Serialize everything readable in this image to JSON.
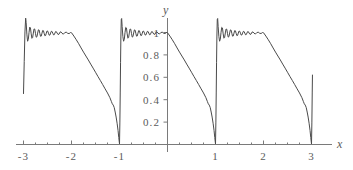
{
  "chart_data": {
    "type": "line",
    "title": "",
    "subtitle": "",
    "xlabel": "x",
    "ylabel": "y",
    "xlim": [
      -3.35,
      3.35
    ],
    "ylim": [
      -0.07,
      1.18
    ],
    "grid": false,
    "legend": null,
    "annotations": [],
    "xticks": [
      -3,
      -2,
      -1,
      1,
      2,
      3
    ],
    "xtick_labels": [
      "-3",
      "-2",
      "-1",
      "1",
      "2",
      "3"
    ],
    "yticks": [
      0.2,
      0.4,
      0.6,
      0.8,
      1
    ],
    "ytick_labels": [
      "0.2",
      "0.4",
      "0.6",
      "0.8",
      "1"
    ],
    "minor_xticks": [
      -2.75,
      -2.5,
      -2.25,
      -1.75,
      -1.5,
      -1.25,
      -0.75,
      -0.5,
      -0.25,
      0.25,
      0.5,
      0.75,
      1.25,
      1.5,
      1.75,
      2.25,
      2.5,
      2.75
    ],
    "series": [
      {
        "name": "fourier-partial-sum",
        "description": "Fourier partial sum of periodic ramp wave, period 2, showing Gibbs ringing",
        "color": "#4a4a4a",
        "points": [
          [
            -3.0,
            0.455
          ],
          [
            -2.985,
            0.74
          ],
          [
            -2.97,
            1.005
          ],
          [
            -2.955,
            1.128
          ],
          [
            -2.945,
            1.09
          ],
          [
            -2.93,
            0.985
          ],
          [
            -2.915,
            0.922
          ],
          [
            -2.9,
            0.938
          ],
          [
            -2.885,
            1.0
          ],
          [
            -2.87,
            1.048
          ],
          [
            -2.855,
            1.04
          ],
          [
            -2.84,
            0.988
          ],
          [
            -2.825,
            0.948
          ],
          [
            -2.81,
            0.955
          ],
          [
            -2.795,
            0.995
          ],
          [
            -2.78,
            1.032
          ],
          [
            -2.765,
            1.03
          ],
          [
            -2.75,
            0.99
          ],
          [
            -2.735,
            0.958
          ],
          [
            -2.72,
            0.962
          ],
          [
            -2.705,
            0.995
          ],
          [
            -2.69,
            1.024
          ],
          [
            -2.675,
            1.022
          ],
          [
            -2.66,
            0.992
          ],
          [
            -2.645,
            0.966
          ],
          [
            -2.63,
            0.968
          ],
          [
            -2.615,
            0.994
          ],
          [
            -2.6,
            1.018
          ],
          [
            -2.585,
            1.016
          ],
          [
            -2.57,
            0.993
          ],
          [
            -2.555,
            0.971
          ],
          [
            -2.54,
            0.973
          ],
          [
            -2.525,
            0.994
          ],
          [
            -2.51,
            1.014
          ],
          [
            -2.495,
            1.012
          ],
          [
            -2.48,
            0.994
          ],
          [
            -2.465,
            0.976
          ],
          [
            -2.45,
            0.977
          ],
          [
            -2.435,
            0.995
          ],
          [
            -2.42,
            1.011
          ],
          [
            -2.405,
            1.009
          ],
          [
            -2.39,
            0.994
          ],
          [
            -2.375,
            0.979
          ],
          [
            -2.36,
            0.98
          ],
          [
            -2.345,
            0.995
          ],
          [
            -2.33,
            1.009
          ],
          [
            -2.315,
            1.007
          ],
          [
            -2.3,
            0.995
          ],
          [
            -2.28,
            0.982
          ],
          [
            -2.26,
            0.985
          ],
          [
            -2.24,
            1.003
          ],
          [
            -2.22,
            1.006
          ],
          [
            -2.2,
            0.994
          ],
          [
            -2.17,
            0.985
          ],
          [
            -2.14,
            0.999
          ],
          [
            -2.11,
            1.003
          ],
          [
            -2.08,
            0.993
          ],
          [
            -2.05,
            0.99
          ],
          [
            -2.02,
            1.0
          ],
          [
            -2.0,
            0.998
          ],
          [
            -1.95,
            0.968
          ],
          [
            -1.9,
            0.935
          ],
          [
            -1.85,
            0.9
          ],
          [
            -1.8,
            0.862
          ],
          [
            -1.75,
            0.825
          ],
          [
            -1.7,
            0.79
          ],
          [
            -1.65,
            0.755
          ],
          [
            -1.6,
            0.718
          ],
          [
            -1.55,
            0.682
          ],
          [
            -1.5,
            0.645
          ],
          [
            -1.45,
            0.608
          ],
          [
            -1.4,
            0.572
          ],
          [
            -1.35,
            0.535
          ],
          [
            -1.3,
            0.497
          ],
          [
            -1.25,
            0.46
          ],
          [
            -1.2,
            0.418
          ],
          [
            -1.17,
            0.385
          ],
          [
            -1.15,
            0.363
          ],
          [
            -1.13,
            0.352
          ],
          [
            -1.11,
            0.33
          ],
          [
            -1.09,
            0.29
          ],
          [
            -1.07,
            0.245
          ],
          [
            -1.05,
            0.19
          ],
          [
            -1.03,
            0.125
          ],
          [
            -1.015,
            0.062
          ],
          [
            -1.0,
            0.005
          ],
          [
            -0.992,
            0.2
          ],
          [
            -0.985,
            0.46
          ],
          [
            -0.978,
            0.73
          ],
          [
            -0.971,
            0.96
          ],
          [
            -0.963,
            1.115
          ],
          [
            -0.955,
            1.125
          ],
          [
            -0.945,
            1.055
          ],
          [
            -0.93,
            0.965
          ],
          [
            -0.915,
            0.922
          ],
          [
            -0.9,
            0.94
          ],
          [
            -0.885,
            1.0
          ],
          [
            -0.87,
            1.046
          ],
          [
            -0.855,
            1.04
          ],
          [
            -0.84,
            0.988
          ],
          [
            -0.825,
            0.949
          ],
          [
            -0.81,
            0.956
          ],
          [
            -0.795,
            0.996
          ],
          [
            -0.78,
            1.031
          ],
          [
            -0.765,
            1.029
          ],
          [
            -0.75,
            0.99
          ],
          [
            -0.735,
            0.959
          ],
          [
            -0.72,
            0.963
          ],
          [
            -0.705,
            0.996
          ],
          [
            -0.69,
            1.023
          ],
          [
            -0.675,
            1.021
          ],
          [
            -0.66,
            0.993
          ],
          [
            -0.645,
            0.967
          ],
          [
            -0.63,
            0.969
          ],
          [
            -0.615,
            0.994
          ],
          [
            -0.6,
            1.017
          ],
          [
            -0.585,
            1.015
          ],
          [
            -0.57,
            0.993
          ],
          [
            -0.555,
            0.972
          ],
          [
            -0.54,
            0.974
          ],
          [
            -0.525,
            0.995
          ],
          [
            -0.51,
            1.013
          ],
          [
            -0.495,
            1.011
          ],
          [
            -0.48,
            0.994
          ],
          [
            -0.465,
            0.977
          ],
          [
            -0.45,
            0.978
          ],
          [
            -0.435,
            0.995
          ],
          [
            -0.42,
            1.01
          ],
          [
            -0.405,
            1.009
          ],
          [
            -0.39,
            0.995
          ],
          [
            -0.375,
            0.98
          ],
          [
            -0.36,
            0.981
          ],
          [
            -0.345,
            0.995
          ],
          [
            -0.33,
            1.008
          ],
          [
            -0.315,
            1.007
          ],
          [
            -0.3,
            0.995
          ],
          [
            -0.28,
            0.983
          ],
          [
            -0.26,
            0.986
          ],
          [
            -0.24,
            1.003
          ],
          [
            -0.22,
            1.005
          ],
          [
            -0.2,
            0.995
          ],
          [
            -0.17,
            0.986
          ],
          [
            -0.14,
            0.999
          ],
          [
            -0.11,
            1.003
          ],
          [
            -0.08,
            0.993
          ],
          [
            -0.05,
            0.991
          ],
          [
            -0.02,
            1.0
          ],
          [
            0.0,
            0.998
          ],
          [
            0.05,
            0.968
          ],
          [
            0.1,
            0.935
          ],
          [
            0.15,
            0.9
          ],
          [
            0.2,
            0.862
          ],
          [
            0.25,
            0.825
          ],
          [
            0.3,
            0.79
          ],
          [
            0.35,
            0.755
          ],
          [
            0.4,
            0.718
          ],
          [
            0.45,
            0.682
          ],
          [
            0.5,
            0.645
          ],
          [
            0.55,
            0.608
          ],
          [
            0.6,
            0.572
          ],
          [
            0.65,
            0.535
          ],
          [
            0.7,
            0.497
          ],
          [
            0.75,
            0.46
          ],
          [
            0.8,
            0.418
          ],
          [
            0.83,
            0.385
          ],
          [
            0.85,
            0.363
          ],
          [
            0.87,
            0.352
          ],
          [
            0.89,
            0.33
          ],
          [
            0.91,
            0.29
          ],
          [
            0.93,
            0.245
          ],
          [
            0.95,
            0.19
          ],
          [
            0.97,
            0.125
          ],
          [
            0.985,
            0.062
          ],
          [
            1.0,
            0.005
          ],
          [
            1.008,
            0.2
          ],
          [
            1.015,
            0.46
          ],
          [
            1.022,
            0.73
          ],
          [
            1.029,
            0.96
          ],
          [
            1.037,
            1.115
          ],
          [
            1.045,
            1.125
          ],
          [
            1.055,
            1.055
          ],
          [
            1.07,
            0.965
          ],
          [
            1.085,
            0.922
          ],
          [
            1.1,
            0.94
          ],
          [
            1.115,
            1.0
          ],
          [
            1.13,
            1.046
          ],
          [
            1.145,
            1.04
          ],
          [
            1.16,
            0.988
          ],
          [
            1.175,
            0.949
          ],
          [
            1.19,
            0.956
          ],
          [
            1.205,
            0.996
          ],
          [
            1.22,
            1.031
          ],
          [
            1.235,
            1.029
          ],
          [
            1.25,
            0.99
          ],
          [
            1.265,
            0.959
          ],
          [
            1.28,
            0.963
          ],
          [
            1.295,
            0.996
          ],
          [
            1.31,
            1.023
          ],
          [
            1.325,
            1.021
          ],
          [
            1.34,
            0.993
          ],
          [
            1.355,
            0.967
          ],
          [
            1.37,
            0.969
          ],
          [
            1.385,
            0.994
          ],
          [
            1.4,
            1.017
          ],
          [
            1.415,
            1.015
          ],
          [
            1.43,
            0.993
          ],
          [
            1.445,
            0.972
          ],
          [
            1.46,
            0.974
          ],
          [
            1.475,
            0.995
          ],
          [
            1.49,
            1.013
          ],
          [
            1.505,
            1.011
          ],
          [
            1.52,
            0.994
          ],
          [
            1.535,
            0.977
          ],
          [
            1.55,
            0.978
          ],
          [
            1.565,
            0.995
          ],
          [
            1.58,
            1.01
          ],
          [
            1.595,
            1.009
          ],
          [
            1.61,
            0.995
          ],
          [
            1.625,
            0.98
          ],
          [
            1.64,
            0.981
          ],
          [
            1.655,
            0.995
          ],
          [
            1.67,
            1.008
          ],
          [
            1.685,
            1.007
          ],
          [
            1.7,
            0.995
          ],
          [
            1.72,
            0.983
          ],
          [
            1.74,
            0.986
          ],
          [
            1.76,
            1.003
          ],
          [
            1.78,
            1.005
          ],
          [
            1.8,
            0.995
          ],
          [
            1.83,
            0.986
          ],
          [
            1.86,
            0.999
          ],
          [
            1.89,
            1.003
          ],
          [
            1.92,
            0.993
          ],
          [
            1.95,
            0.991
          ],
          [
            1.98,
            1.0
          ],
          [
            2.0,
            0.998
          ],
          [
            2.05,
            0.968
          ],
          [
            2.1,
            0.935
          ],
          [
            2.15,
            0.9
          ],
          [
            2.2,
            0.862
          ],
          [
            2.25,
            0.825
          ],
          [
            2.3,
            0.79
          ],
          [
            2.35,
            0.755
          ],
          [
            2.4,
            0.718
          ],
          [
            2.45,
            0.682
          ],
          [
            2.5,
            0.645
          ],
          [
            2.55,
            0.608
          ],
          [
            2.6,
            0.572
          ],
          [
            2.65,
            0.535
          ],
          [
            2.7,
            0.497
          ],
          [
            2.75,
            0.46
          ],
          [
            2.8,
            0.418
          ],
          [
            2.83,
            0.385
          ],
          [
            2.85,
            0.363
          ],
          [
            2.87,
            0.352
          ],
          [
            2.89,
            0.33
          ],
          [
            2.91,
            0.29
          ],
          [
            2.93,
            0.245
          ],
          [
            2.95,
            0.19
          ],
          [
            2.97,
            0.125
          ],
          [
            2.985,
            0.062
          ],
          [
            3.0,
            0.005
          ],
          [
            3.008,
            0.2
          ],
          [
            3.015,
            0.46
          ],
          [
            3.02,
            0.62
          ]
        ]
      }
    ]
  },
  "axes": {
    "x_axis_label": "x",
    "y_axis_label": "y"
  }
}
